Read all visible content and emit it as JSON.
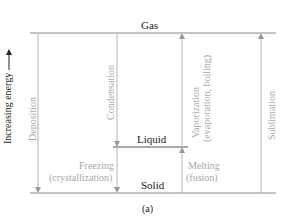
{
  "diagram": {
    "caption": "(a)",
    "axis_label": "Increasing energy",
    "levels": {
      "gas": "Gas",
      "liquid": "Liquid",
      "solid": "Solid"
    },
    "transitions": {
      "deposition": "Deposition",
      "condensation": "Condensation",
      "vaporization_line1": "Vaporization",
      "vaporization_line2": "(evaporation, boiling)",
      "sublimation": "Sublimation",
      "freezing_line1": "Freezing",
      "freezing_line2": "(crystallization)",
      "melting_line1": "Melting",
      "melting_line2": "(fusion)"
    },
    "colors": {
      "level_line": "#888888",
      "arrow_line": "#b5b5b5",
      "level_text": "#1a1a1a",
      "process_text": "#a9a9a9"
    }
  }
}
